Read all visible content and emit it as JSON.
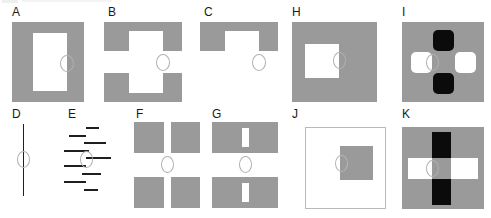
{
  "figure": {
    "title": "",
    "background_color": "#ffffff",
    "panel_count": 11,
    "colors": {
      "gray_fill": "#9a9a9a",
      "white_fill": "#ffffff",
      "black_fill": "#0b0b0b",
      "line_color": "#1f1f1f",
      "marker_outline": "#b0b0b0",
      "label_color": "#1a1a1a",
      "border_color": "#b9b9b9"
    },
    "marker": {
      "name": "ellipse-marker",
      "shape": "ellipse-outline",
      "description": "small unfilled ellipse indicating the probe / fixation location"
    },
    "panels": [
      {
        "id": "A",
        "label": "A",
        "description": "solid gray rectangle containing a tall white rectangular aperture; marker straddles right edge of aperture"
      },
      {
        "id": "B",
        "label": "B",
        "description": "gray rectangle split into upper and lower halves with a notched white channel; marker sits in the central gap"
      },
      {
        "id": "C",
        "label": "C",
        "description": "only the upper half of the notched gray shape; marker floats below in empty white space"
      },
      {
        "id": "D",
        "label": "D",
        "description": "single vertical line with the marker centered on it"
      },
      {
        "id": "E",
        "label": "E",
        "description": "staggered stack of short horizontal line segments with the marker at the centre"
      },
      {
        "id": "F",
        "label": "F",
        "description": "two gray rectangles each bisected by a full-height white slot; marker in the gap between them"
      },
      {
        "id": "G",
        "label": "G",
        "description": "two gray rectangles each containing a short white bar; marker in the gap between them"
      },
      {
        "id": "H",
        "label": "H",
        "description": "large gray square with a white square aperture offset left; marker on aperture right edge"
      },
      {
        "id": "I",
        "label": "I",
        "description": "gray square with a plus arrangement: black rounded squares above and below, white rounded squares left and right; marker centred"
      },
      {
        "id": "J",
        "label": "J",
        "description": "white square with thin border containing a gray square; marker on gray square left edge"
      },
      {
        "id": "K",
        "label": "K",
        "description": "gray square crossed by a black vertical bar and a white horizontal bar; intersection remains gray"
      }
    ]
  }
}
